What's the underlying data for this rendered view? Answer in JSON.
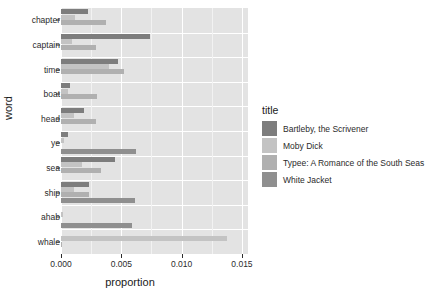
{
  "chart_data": {
    "type": "bar",
    "orientation": "horizontal",
    "title": "",
    "xlabel": "proportion",
    "ylabel": "word",
    "xlim": [
      0,
      0.0155
    ],
    "xticks": [
      0.0,
      0.005,
      0.01,
      0.015
    ],
    "xticklabels": [
      "0.000",
      "0.005",
      "0.010",
      "0.015"
    ],
    "grid": true,
    "legend": {
      "title": "title",
      "position": "right",
      "entries": [
        {
          "name": "Bartleby, the Scrivener",
          "color": "#7d7d7d"
        },
        {
          "name": "Moby Dick",
          "color": "#c3c3c3"
        },
        {
          "name": "Typee: A Romance of the South Seas",
          "color": "#b0b0b0"
        },
        {
          "name": "White Jacket",
          "color": "#8f8f8f"
        }
      ]
    },
    "categories": [
      "chapter",
      "captain",
      "time",
      "boat",
      "head",
      "ye",
      "sea",
      "ship",
      "ahab",
      "whale"
    ],
    "series": [
      {
        "name": "Bartleby, the Scrivener",
        "color": "#7d7d7d",
        "values": [
          0.00225,
          0.0074,
          0.00475,
          0.00075,
          0.0019,
          0.0006,
          0.0045,
          0.0023,
          0.0,
          0.0
        ]
      },
      {
        "name": "Moby Dick",
        "color": "#c3c3c3",
        "values": [
          0.0012,
          0.0009,
          0.00395,
          0.00055,
          0.00105,
          0.00025,
          0.00175,
          0.00105,
          0.0002,
          0.0138
        ]
      },
      {
        "name": "Typee: A Romance of the South Seas",
        "color": "#b0b0b0",
        "values": [
          0.0037,
          0.0029,
          0.00525,
          0.003,
          0.0029,
          0.0,
          0.0033,
          0.0023,
          0.0,
          0.0001
        ]
      },
      {
        "name": "White Jacket",
        "color": "#8f8f8f",
        "values": [
          0.0,
          0.0,
          0.0,
          0.0,
          0.0,
          0.0062,
          0.0,
          0.0061,
          0.0059,
          0.0
        ]
      }
    ]
  }
}
